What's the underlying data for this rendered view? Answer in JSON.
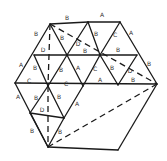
{
  "diagram": {
    "type": "triangulated-hexagon",
    "vertices": {
      "t1": [
        50,
        24
      ],
      "t2": [
        88,
        22
      ],
      "t3": [
        120,
        22
      ],
      "m1": [
        34,
        55
      ],
      "m2": [
        67,
        55
      ],
      "m3": [
        100,
        55
      ],
      "m4": [
        137,
        55
      ],
      "c0": [
        15,
        83
      ],
      "c1": [
        48,
        86
      ],
      "c2": [
        83,
        86
      ],
      "c3": [
        118,
        85
      ],
      "c4": [
        157,
        84
      ],
      "l1": [
        30,
        113
      ],
      "l2": [
        64,
        118
      ],
      "b1": [
        48,
        147
      ],
      "b2": [
        118,
        150
      ]
    },
    "edges": [
      [
        "t1",
        "t2"
      ],
      [
        "t2",
        "t3"
      ],
      [
        "t3",
        "c4"
      ],
      [
        "c4",
        "b2"
      ],
      [
        "b2",
        "b1"
      ],
      [
        "b1",
        "c0"
      ],
      [
        "c0",
        "t1"
      ],
      [
        "m1",
        "m4"
      ],
      [
        "c0",
        "c4"
      ],
      [
        "t1",
        "m2"
      ],
      [
        "t2",
        "m2"
      ],
      [
        "t2",
        "m3"
      ],
      [
        "t3",
        "m3"
      ],
      [
        "m1",
        "c1"
      ],
      [
        "m2",
        "c1"
      ],
      [
        "m2",
        "c2"
      ],
      [
        "m3",
        "c2"
      ],
      [
        "m3",
        "c3"
      ],
      [
        "m4",
        "c3"
      ],
      [
        "c1",
        "l1"
      ],
      [
        "c1",
        "l2"
      ],
      [
        "l1",
        "l2"
      ],
      [
        "c2",
        "l2"
      ],
      [
        "l1",
        "b1"
      ],
      [
        "l2",
        "b1"
      ]
    ],
    "dashed": [
      [
        "t1",
        "c1"
      ],
      [
        "t1",
        "c4"
      ],
      [
        "c1",
        "b1"
      ],
      [
        "c4",
        "b1"
      ]
    ],
    "labels": [
      {
        "t": "B",
        "x": 67,
        "y": 20
      },
      {
        "t": "A",
        "x": 102,
        "y": 17
      },
      {
        "t": "B",
        "x": 36,
        "y": 36
      },
      {
        "t": "B",
        "x": 62,
        "y": 40
      },
      {
        "t": "D",
        "x": 78,
        "y": 46
      },
      {
        "t": "B",
        "x": 96,
        "y": 36
      },
      {
        "t": "C",
        "x": 115,
        "y": 37
      },
      {
        "t": "A",
        "x": 131,
        "y": 35
      },
      {
        "t": "D",
        "x": 43,
        "y": 52
      },
      {
        "t": "B",
        "x": 85,
        "y": 53
      },
      {
        "t": "B",
        "x": 118,
        "y": 52
      },
      {
        "t": "A",
        "x": 21,
        "y": 67
      },
      {
        "t": "B",
        "x": 35,
        "y": 70
      },
      {
        "t": "B",
        "x": 61,
        "y": 72
      },
      {
        "t": "A",
        "x": 78,
        "y": 70
      },
      {
        "t": "C",
        "x": 95,
        "y": 71
      },
      {
        "t": "B",
        "x": 112,
        "y": 70
      },
      {
        "t": "D",
        "x": 130,
        "y": 73
      },
      {
        "t": "B",
        "x": 149,
        "y": 66
      },
      {
        "t": "C",
        "x": 29,
        "y": 83
      },
      {
        "t": "C",
        "x": 66,
        "y": 86
      },
      {
        "t": "A",
        "x": 100,
        "y": 82
      },
      {
        "t": "B",
        "x": 133,
        "y": 82
      },
      {
        "t": "A",
        "x": 18,
        "y": 99
      },
      {
        "t": "B",
        "x": 36,
        "y": 100
      },
      {
        "t": "B",
        "x": 59,
        "y": 99
      },
      {
        "t": "A",
        "x": 77,
        "y": 106
      },
      {
        "t": "D",
        "x": 42,
        "y": 112
      },
      {
        "t": "B",
        "x": 32,
        "y": 133
      },
      {
        "t": "B",
        "x": 60,
        "y": 134
      }
    ]
  }
}
